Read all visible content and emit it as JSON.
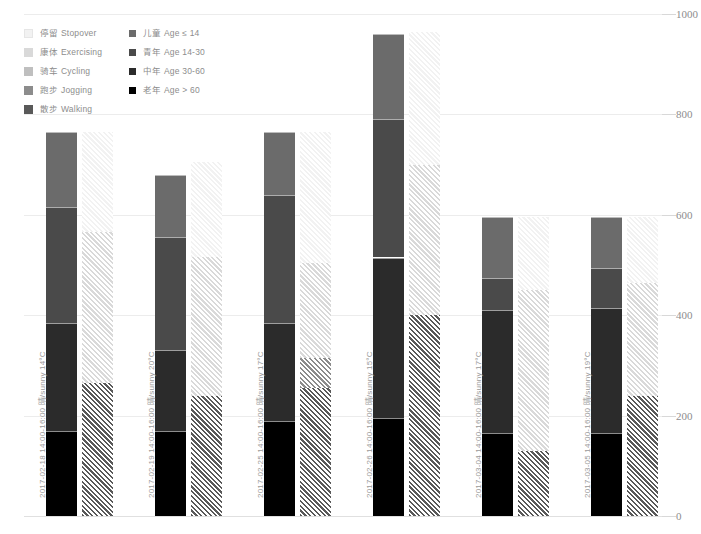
{
  "legend": {
    "activity": [
      {
        "label": "停留 Stopover",
        "color": "#f2f2f2"
      },
      {
        "label": "康体 Exercising",
        "color": "#d9d9d9"
      },
      {
        "label": "骑车 Cycling",
        "color": "#bfbfbf"
      },
      {
        "label": "跑步 Jogging",
        "color": "#8c8c8c"
      },
      {
        "label": "散步 Walking",
        "color": "#595959"
      }
    ],
    "age": [
      {
        "label": "儿童 Age ≤ 14",
        "color": "#6b6b6b"
      },
      {
        "label": "青年 Age 14-30",
        "color": "#4a4a4a"
      },
      {
        "label": "中年 Age 30-60",
        "color": "#2b2b2b"
      },
      {
        "label": "老年 Age > 60",
        "color": "#000000"
      }
    ]
  },
  "axis": {
    "y_ticks": [
      "1000",
      "800",
      "600",
      "400",
      "200",
      "0"
    ],
    "y_min": 0,
    "y_max": 1000
  },
  "chart_data": {
    "type": "bar",
    "title": "",
    "xlabel": "",
    "ylabel": "",
    "ylim": [
      0,
      1000
    ],
    "grid": true,
    "legend_position": "top-left",
    "stacked": true,
    "categories": [
      "2017-02-18  14:00-16:00  晴/sunny  14°C",
      "2017-02-19  14:00-16:00  晴/sunny  20°C",
      "2017-02-25  14:00-16:00  晴/sunny  17°C",
      "2017-02-26  14:00-16:00  晴/sunny  15°C",
      "2017-03-04  14:00-16:00  晴/sunny  17°C",
      "2017-03-05  14:00-16:00  晴/sunny  19°C"
    ],
    "category_parts": [
      {
        "date": "2017-02-18",
        "time": "14:00-16:00",
        "weather": "晴/sunny",
        "temp": "14°C"
      },
      {
        "date": "2017-02-19",
        "time": "14:00-16:00",
        "weather": "晴/sunny",
        "temp": "20°C"
      },
      {
        "date": "2017-02-25",
        "time": "14:00-16:00",
        "weather": "晴/sunny",
        "temp": "17°C"
      },
      {
        "date": "2017-02-26",
        "time": "14:00-16:00",
        "weather": "晴/sunny",
        "temp": "15°C"
      },
      {
        "date": "2017-03-04",
        "time": "14:00-16:00",
        "weather": "晴/sunny",
        "temp": "17°C"
      },
      {
        "date": "2017-03-05",
        "time": "14:00-16:00",
        "weather": "晴/sunny",
        "temp": "19°C"
      }
    ],
    "bars": [
      {
        "name": "age",
        "style": "solid",
        "series": [
          {
            "name": "老年 Age > 60",
            "color": "#000000",
            "values": [
              170,
              170,
              190,
              195,
              165,
              165
            ]
          },
          {
            "name": "中年 Age 30-60",
            "color": "#2b2b2b",
            "values": [
              215,
              160,
              195,
              320,
              245,
              250
            ]
          },
          {
            "name": "青年 Age 14-30",
            "color": "#4a4a4a",
            "values": [
              230,
              225,
              255,
              275,
              65,
              80
            ]
          },
          {
            "name": "儿童 Age ≤ 14",
            "color": "#6b6b6b",
            "values": [
              150,
              125,
              125,
              170,
              120,
              100
            ]
          }
        ]
      },
      {
        "name": "activity",
        "style": "hatched",
        "series": [
          {
            "name": "散步 Walking",
            "color": "#595959",
            "values": [
              265,
              240,
              255,
              400,
              130,
              240
            ]
          },
          {
            "name": "跑步 Jogging",
            "color": "#8c8c8c",
            "values": [
              0,
              0,
              60,
              0,
              0,
              0
            ]
          },
          {
            "name": "骑车 Cycling",
            "color": "#bfbfbf",
            "values": [
              0,
              0,
              0,
              0,
              0,
              0
            ]
          },
          {
            "name": "康体 Exercising",
            "color": "#d9d9d9",
            "values": [
              300,
              275,
              190,
              300,
              320,
              225
            ]
          },
          {
            "name": "停留 Stopover",
            "color": "#f2f2f2",
            "values": [
              200,
              190,
              260,
              265,
              145,
              130
            ]
          }
        ]
      }
    ],
    "totals_age": [
      765,
      680,
      765,
      960,
      595,
      595
    ],
    "totals_activity": [
      765,
      705,
      765,
      965,
      595,
      595
    ]
  }
}
